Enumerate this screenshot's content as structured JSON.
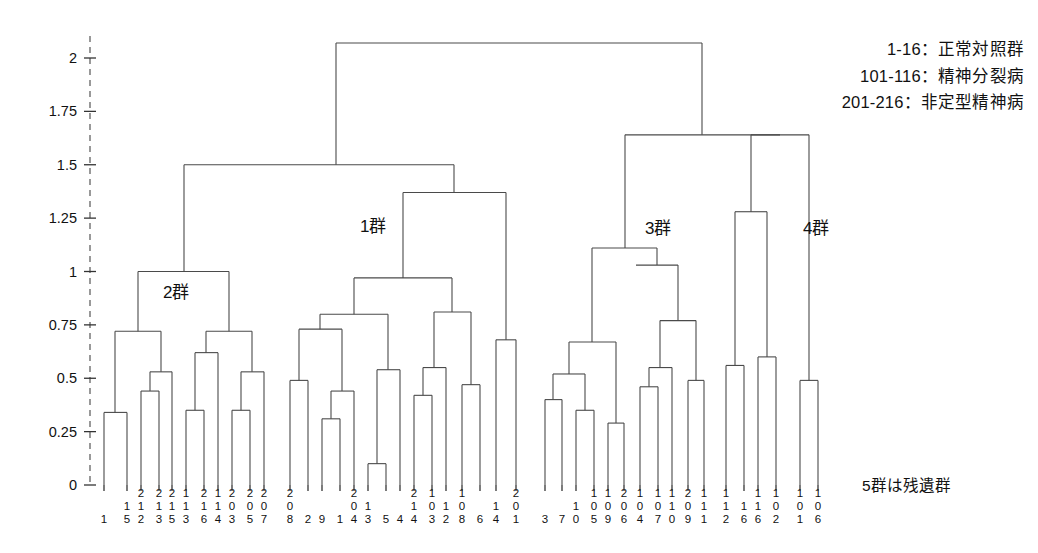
{
  "legend": {
    "lines": [
      "1-16：正常対照群",
      "101-116：精神分裂病",
      "201-216：非定型精神病"
    ]
  },
  "note": "5群は残遺群",
  "cluster_labels": [
    {
      "text": "1群",
      "x": 360,
      "y": 212
    },
    {
      "text": "2群",
      "x": 163,
      "y": 278
    },
    {
      "text": "3群",
      "x": 645,
      "y": 214
    },
    {
      "text": "4群",
      "x": 803,
      "y": 214
    }
  ],
  "chart_data": {
    "type": "dendrogram",
    "title": "",
    "xlabel": "",
    "ylabel": "",
    "ylim": [
      0,
      2.12
    ],
    "grid": false,
    "legend_position": "top-right",
    "y_ticks": [
      0,
      0.25,
      0.5,
      0.75,
      1,
      1.25,
      1.5,
      1.75,
      2
    ],
    "y_tick_labels": [
      "0",
      "0.25",
      "0.5",
      "0.75",
      "1",
      "1.25",
      "1.5",
      "1.75",
      "2"
    ],
    "leaves": [
      "1",
      "15",
      "212",
      "213",
      "215",
      "113",
      "216",
      "114",
      "203",
      "205",
      "207",
      "208",
      "2",
      "9",
      "1",
      "204",
      "13",
      "5",
      "4",
      "214",
      "103",
      "12",
      "108",
      "6",
      "14",
      "201",
      "3",
      "7",
      "10",
      "105",
      "109",
      "206",
      "104",
      "107",
      "110",
      "209",
      "111",
      "112",
      "16",
      "116",
      "102",
      "101",
      "106"
    ],
    "merges": [
      {
        "left": 0,
        "right": 1,
        "height": 0.34
      },
      {
        "left": 2,
        "right": 3,
        "height": 0.44
      },
      {
        "left": "m1",
        "right": 4,
        "height": 0.53
      },
      {
        "left": "m0",
        "right": "m2",
        "height": 0.72
      },
      {
        "left": 5,
        "right": 6,
        "height": 0.35
      },
      {
        "left": 7,
        "right": 8,
        "height": 0.35
      },
      {
        "left": "m4",
        "right": "m5",
        "height": 0.62
      },
      {
        "left": 9,
        "right": 10,
        "height": 0.53
      },
      {
        "left": "m7",
        "right": 11,
        "height": 0.72
      },
      {
        "left": "m6",
        "right": "m8",
        "height": 0.72
      },
      {
        "left": "m3",
        "right": "m9",
        "height": 1.0
      },
      {
        "left": 12,
        "right": 13,
        "height": 0.49
      },
      {
        "left": 14,
        "right": 15,
        "height": 0.31
      },
      {
        "left": "m12",
        "right": 16,
        "height": 0.44
      },
      {
        "left": "m11",
        "right": "m13",
        "height": 0.73
      },
      {
        "left": 17,
        "right": 18,
        "height": 0.1
      },
      {
        "left": "m15",
        "right": 19,
        "height": 0.54
      },
      {
        "left": "m14",
        "right": "m16",
        "height": 0.8
      },
      {
        "left": 20,
        "right": 21,
        "height": 0.42
      },
      {
        "left": "m18",
        "right": 22,
        "height": 0.55
      },
      {
        "left": 23,
        "right": 24,
        "height": 0.47
      },
      {
        "left": "m20",
        "right": "m21",
        "height": 0.81
      },
      {
        "left": "m19",
        "right": "m21",
        "height": 0.81
      },
      {
        "left": "m17",
        "right": "m22",
        "height": 0.97
      },
      {
        "left": 25,
        "right": 26,
        "height": 0.68
      },
      {
        "left": "m23",
        "right": "m24",
        "height": 1.37
      },
      {
        "left": "m10",
        "right": "m25",
        "height": 1.5
      },
      {
        "left": 27,
        "right": 28,
        "height": 0.4
      },
      {
        "left": 29,
        "right": 30,
        "height": 0.35
      },
      {
        "left": "m27",
        "right": "m28",
        "height": 0.52
      },
      {
        "left": 31,
        "right": 32,
        "height": 0.29
      },
      {
        "left": "m29",
        "right": "m30",
        "height": 0.67
      },
      {
        "left": 33,
        "right": 34,
        "height": 0.46
      },
      {
        "left": "m32",
        "right": 35,
        "height": 0.55
      },
      {
        "left": 36,
        "right": 37,
        "height": 0.49
      },
      {
        "left": "m33",
        "right": "m34",
        "height": 0.77
      },
      {
        "left": "m35",
        "right": "x",
        "height": 1.03
      },
      {
        "left": "m31",
        "right": "m36",
        "height": 1.11
      },
      {
        "left": 38,
        "right": 39,
        "height": 0.56
      },
      {
        "left": 40,
        "right": 41,
        "height": 0.6
      },
      {
        "left": "m38",
        "right": "m39",
        "height": 1.28
      },
      {
        "left": "m40",
        "right": 42,
        "height": 1.28
      },
      {
        "left": "m37",
        "right": "m41",
        "height": 1.64
      },
      {
        "left": "m26",
        "right": "m42",
        "height": 2.07
      }
    ],
    "segments": [
      {
        "kind": "leaf",
        "x": 104,
        "y0": 0,
        "y1": 0.34
      },
      {
        "kind": "leaf",
        "x": 127,
        "y0": 0,
        "y1": 0.34
      },
      {
        "kind": "hbar",
        "x0": 104,
        "x1": 127,
        "y": 0.34
      },
      {
        "kind": "vstem",
        "x": 115,
        "y0": 0.34,
        "y1": 0.72
      },
      {
        "kind": "leaf",
        "x": 141,
        "y0": 0,
        "y1": 0.44
      },
      {
        "kind": "leaf",
        "x": 159,
        "y0": 0,
        "y1": 0.44
      },
      {
        "kind": "hbar",
        "x0": 141,
        "x1": 159,
        "y": 0.44
      },
      {
        "kind": "vstem",
        "x": 150,
        "y0": 0.44,
        "y1": 0.53
      },
      {
        "kind": "leaf",
        "x": 172,
        "y0": 0,
        "y1": 0.53
      },
      {
        "kind": "hbar",
        "x0": 150,
        "x1": 172,
        "y": 0.53
      },
      {
        "kind": "vstem",
        "x": 161,
        "y0": 0.53,
        "y1": 0.72
      },
      {
        "kind": "hbar",
        "x0": 115,
        "x1": 161,
        "y": 0.72
      },
      {
        "kind": "vstem",
        "x": 138,
        "y0": 0.72,
        "y1": 1.0
      },
      {
        "kind": "leaf",
        "x": 186,
        "y0": 0,
        "y1": 0.35
      },
      {
        "kind": "leaf",
        "x": 204,
        "y0": 0,
        "y1": 0.35
      },
      {
        "kind": "hbar",
        "x0": 186,
        "x1": 204,
        "y": 0.35
      },
      {
        "kind": "vstem",
        "x": 195,
        "y0": 0.35,
        "y1": 0.62
      },
      {
        "kind": "leaf",
        "x": 218,
        "y0": 0,
        "y1": 0.62
      },
      {
        "kind": "hbar",
        "x0": 195,
        "x1": 218,
        "y": 0.62
      },
      {
        "kind": "vstem",
        "x": 206,
        "y0": 0.62,
        "y1": 0.72
      },
      {
        "kind": "leaf",
        "x": 232,
        "y0": 0,
        "y1": 0.35
      },
      {
        "kind": "leaf",
        "x": 250,
        "y0": 0,
        "y1": 0.35
      },
      {
        "kind": "hbar",
        "x0": 232,
        "x1": 250,
        "y": 0.35
      },
      {
        "kind": "vstem",
        "x": 241,
        "y0": 0.35,
        "y1": 0.53
      },
      {
        "kind": "leaf",
        "x": 264,
        "y0": 0,
        "y1": 0.53
      },
      {
        "kind": "hbar",
        "x0": 241,
        "x1": 264,
        "y": 0.53
      },
      {
        "kind": "vstem",
        "x": 252,
        "y0": 0.53,
        "y1": 0.72
      },
      {
        "kind": "hbar",
        "x0": 206,
        "x1": 252,
        "y": 0.72
      },
      {
        "kind": "vstem",
        "x": 229,
        "y0": 0.72,
        "y1": 1.0
      },
      {
        "kind": "hbar",
        "x0": 138,
        "x1": 229,
        "y": 1.0
      },
      {
        "kind": "vstem",
        "x": 184,
        "y0": 1.0,
        "y1": 1.5
      },
      {
        "kind": "leaf",
        "x": 290,
        "y0": 0,
        "y1": 0.49
      },
      {
        "kind": "leaf",
        "x": 308,
        "y0": 0,
        "y1": 0.49
      },
      {
        "kind": "hbar",
        "x0": 290,
        "x1": 308,
        "y": 0.49
      },
      {
        "kind": "vstem",
        "x": 299,
        "y0": 0.49,
        "y1": 0.73
      },
      {
        "kind": "leaf",
        "x": 322,
        "y0": 0,
        "y1": 0.31
      },
      {
        "kind": "leaf",
        "x": 340,
        "y0": 0,
        "y1": 0.31
      },
      {
        "kind": "hbar",
        "x0": 322,
        "x1": 340,
        "y": 0.31
      },
      {
        "kind": "vstem",
        "x": 331,
        "y0": 0.31,
        "y1": 0.44
      },
      {
        "kind": "leaf",
        "x": 354,
        "y0": 0,
        "y1": 0.44
      },
      {
        "kind": "hbar",
        "x0": 331,
        "x1": 354,
        "y": 0.44
      },
      {
        "kind": "vstem",
        "x": 342,
        "y0": 0.44,
        "y1": 0.73
      },
      {
        "kind": "hbar",
        "x0": 299,
        "x1": 342,
        "y": 0.73
      },
      {
        "kind": "vstem",
        "x": 320,
        "y0": 0.73,
        "y1": 0.8
      },
      {
        "kind": "leaf",
        "x": 368,
        "y0": 0,
        "y1": 0.1
      },
      {
        "kind": "leaf",
        "x": 386,
        "y0": 0,
        "y1": 0.1
      },
      {
        "kind": "hbar",
        "x0": 368,
        "x1": 386,
        "y": 0.1
      },
      {
        "kind": "vstem",
        "x": 377,
        "y0": 0.1,
        "y1": 0.54
      },
      {
        "kind": "leaf",
        "x": 400,
        "y0": 0,
        "y1": 0.54
      },
      {
        "kind": "hbar",
        "x0": 377,
        "x1": 400,
        "y": 0.54
      },
      {
        "kind": "vstem",
        "x": 388,
        "y0": 0.54,
        "y1": 0.8
      },
      {
        "kind": "hbar",
        "x0": 320,
        "x1": 388,
        "y": 0.8
      },
      {
        "kind": "vstem",
        "x": 354,
        "y0": 0.8,
        "y1": 0.97
      },
      {
        "kind": "leaf",
        "x": 414,
        "y0": 0,
        "y1": 0.42
      },
      {
        "kind": "leaf",
        "x": 432,
        "y0": 0,
        "y1": 0.42
      },
      {
        "kind": "hbar",
        "x0": 414,
        "x1": 432,
        "y": 0.42
      },
      {
        "kind": "vstem",
        "x": 423,
        "y0": 0.42,
        "y1": 0.55
      },
      {
        "kind": "leaf",
        "x": 446,
        "y0": 0,
        "y1": 0.55
      },
      {
        "kind": "hbar",
        "x0": 423,
        "x1": 446,
        "y": 0.55
      },
      {
        "kind": "vstem",
        "x": 434,
        "y0": 0.55,
        "y1": 0.81
      },
      {
        "kind": "leaf",
        "x": 462,
        "y0": 0,
        "y1": 0.47
      },
      {
        "kind": "leaf",
        "x": 480,
        "y0": 0,
        "y1": 0.47
      },
      {
        "kind": "hbar",
        "x0": 462,
        "x1": 480,
        "y": 0.47
      },
      {
        "kind": "vstem",
        "x": 471,
        "y0": 0.47,
        "y1": 0.81
      },
      {
        "kind": "hbar",
        "x0": 434,
        "x1": 471,
        "y": 0.81
      },
      {
        "kind": "vstem",
        "x": 452,
        "y0": 0.81,
        "y1": 0.97
      },
      {
        "kind": "hbar",
        "x0": 354,
        "x1": 452,
        "y": 0.97
      },
      {
        "kind": "vstem",
        "x": 403,
        "y0": 0.97,
        "y1": 1.37
      },
      {
        "kind": "leaf",
        "x": 496,
        "y0": 0,
        "y1": 0.68
      },
      {
        "kind": "leaf",
        "x": 516,
        "y0": 0,
        "y1": 0.68
      },
      {
        "kind": "hbar",
        "x0": 496,
        "x1": 516,
        "y": 0.68
      },
      {
        "kind": "vstem",
        "x": 506,
        "y0": 0.68,
        "y1": 1.37
      },
      {
        "kind": "hbar",
        "x0": 403,
        "x1": 506,
        "y": 1.37
      },
      {
        "kind": "vstem",
        "x": 454,
        "y0": 1.37,
        "y1": 1.5
      },
      {
        "kind": "hbar",
        "x0": 184,
        "x1": 454,
        "y": 1.5
      },
      {
        "kind": "vstem",
        "x": 336,
        "y0": 1.5,
        "y1": 2.07
      },
      {
        "kind": "leaf",
        "x": 545,
        "y0": 0,
        "y1": 0.4
      },
      {
        "kind": "leaf",
        "x": 562,
        "y0": 0,
        "y1": 0.4
      },
      {
        "kind": "hbar",
        "x0": 545,
        "x1": 562,
        "y": 0.4
      },
      {
        "kind": "vstem",
        "x": 553,
        "y0": 0.4,
        "y1": 0.52
      },
      {
        "kind": "leaf",
        "x": 576,
        "y0": 0,
        "y1": 0.35
      },
      {
        "kind": "leaf",
        "x": 594,
        "y0": 0,
        "y1": 0.35
      },
      {
        "kind": "hbar",
        "x0": 576,
        "x1": 594,
        "y": 0.35
      },
      {
        "kind": "vstem",
        "x": 585,
        "y0": 0.35,
        "y1": 0.52
      },
      {
        "kind": "hbar",
        "x0": 553,
        "x1": 585,
        "y": 0.52
      },
      {
        "kind": "vstem",
        "x": 569,
        "y0": 0.52,
        "y1": 0.67
      },
      {
        "kind": "leaf",
        "x": 608,
        "y0": 0,
        "y1": 0.29
      },
      {
        "kind": "leaf",
        "x": 624,
        "y0": 0,
        "y1": 0.29
      },
      {
        "kind": "hbar",
        "x0": 608,
        "x1": 624,
        "y": 0.29
      },
      {
        "kind": "vstem",
        "x": 616,
        "y0": 0.29,
        "y1": 0.67
      },
      {
        "kind": "hbar",
        "x0": 569,
        "x1": 616,
        "y": 0.67
      },
      {
        "kind": "vstem",
        "x": 592,
        "y0": 0.67,
        "y1": 1.11
      },
      {
        "kind": "leaf",
        "x": 640,
        "y0": 0,
        "y1": 0.46
      },
      {
        "kind": "leaf",
        "x": 658,
        "y0": 0,
        "y1": 0.46
      },
      {
        "kind": "hbar",
        "x0": 640,
        "x1": 658,
        "y": 0.46
      },
      {
        "kind": "vstem",
        "x": 649,
        "y0": 0.46,
        "y1": 0.55
      },
      {
        "kind": "leaf",
        "x": 672,
        "y0": 0,
        "y1": 0.55
      },
      {
        "kind": "hbar",
        "x0": 649,
        "x1": 672,
        "y": 0.55
      },
      {
        "kind": "vstem",
        "x": 660,
        "y0": 0.55,
        "y1": 0.77
      },
      {
        "kind": "leaf",
        "x": 688,
        "y0": 0,
        "y1": 0.49
      },
      {
        "kind": "leaf",
        "x": 704,
        "y0": 0,
        "y1": 0.49
      },
      {
        "kind": "hbar",
        "x0": 688,
        "x1": 704,
        "y": 0.49
      },
      {
        "kind": "vstem",
        "x": 696,
        "y0": 0.49,
        "y1": 0.77
      },
      {
        "kind": "hbar",
        "x0": 660,
        "x1": 696,
        "y": 0.77
      },
      {
        "kind": "vstem",
        "x": 678,
        "y0": 0.77,
        "y1": 1.03
      },
      {
        "kind": "hbar",
        "x0": 636,
        "x1": 678,
        "y": 1.03
      },
      {
        "kind": "vstem",
        "x": 636,
        "y0": 1.03,
        "y1": 1.03
      },
      {
        "kind": "vstem",
        "x": 657,
        "y0": 1.03,
        "y1": 1.11
      },
      {
        "kind": "hbar",
        "x0": 592,
        "x1": 657,
        "y": 1.11
      },
      {
        "kind": "vstem",
        "x": 625,
        "y0": 1.11,
        "y1": 1.64
      },
      {
        "kind": "leaf",
        "x": 726,
        "y0": 0,
        "y1": 0.56
      },
      {
        "kind": "leaf",
        "x": 744,
        "y0": 0,
        "y1": 0.56
      },
      {
        "kind": "hbar",
        "x0": 726,
        "x1": 744,
        "y": 0.56
      },
      {
        "kind": "vstem",
        "x": 735,
        "y0": 0.56,
        "y1": 1.28
      },
      {
        "kind": "leaf",
        "x": 758,
        "y0": 0,
        "y1": 0.6
      },
      {
        "kind": "leaf",
        "x": 776,
        "y0": 0,
        "y1": 0.6
      },
      {
        "kind": "hbar",
        "x0": 758,
        "x1": 776,
        "y": 0.6
      },
      {
        "kind": "vstem",
        "x": 767,
        "y0": 0.6,
        "y1": 1.28
      },
      {
        "kind": "hbar",
        "x0": 735,
        "x1": 767,
        "y": 1.28
      },
      {
        "kind": "vstem",
        "x": 751,
        "y0": 1.28,
        "y1": 1.64
      },
      {
        "kind": "leaf",
        "x": 800,
        "y0": 0,
        "y1": 0.49
      },
      {
        "kind": "leaf",
        "x": 818,
        "y0": 0,
        "y1": 0.49
      },
      {
        "kind": "hbar",
        "x0": 800,
        "x1": 818,
        "y": 0.49
      },
      {
        "kind": "vstem",
        "x": 809,
        "y0": 0.49,
        "y1": 1.64
      },
      {
        "kind": "hbar",
        "x0": 751,
        "x1": 809,
        "y": 1.64
      },
      {
        "kind": "vstem",
        "x": 780,
        "y0": 1.64,
        "y1": 1.64
      },
      {
        "kind": "hbar",
        "x0": 625,
        "x1": 780,
        "y": 1.64
      },
      {
        "kind": "vstem",
        "x": 702,
        "y0": 1.64,
        "y1": 2.07
      },
      {
        "kind": "hbar",
        "x0": 336,
        "x1": 702,
        "y": 2.07
      }
    ]
  }
}
